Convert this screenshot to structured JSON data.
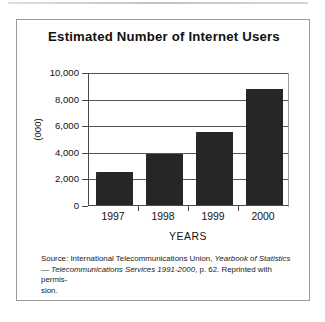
{
  "figure": {
    "title": "Estimated Number of Internet Users",
    "source_caption": {
      "line1_prefix": "Source: International Telecommunications Union, ",
      "line1_italic": "Yearbook of Statistics",
      "line2_dash": "— ",
      "line2_italic": "Telecommunications Services 1991-2000",
      "line2_suffix": ", p. 62. Reprinted with permis-",
      "line3": "sion."
    }
  },
  "chart_data": {
    "type": "bar",
    "title": "Estimated Number of Internet Users",
    "categories": [
      "1997",
      "1998",
      "1999",
      "2000"
    ],
    "values": [
      2500,
      3800,
      5500,
      8700
    ],
    "xlabel": "YEARS",
    "ylabel": "(000)",
    "ylim": [
      0,
      10000
    ],
    "yticks": [
      0,
      2000,
      4000,
      6000,
      8000,
      10000
    ],
    "ytick_labels": [
      "0",
      "2,000",
      "4,000",
      "6,000",
      "8,000",
      "10,000"
    ],
    "grid": true,
    "legend": false,
    "bar_color": "#262626",
    "axis_color": "#4a4a4a"
  }
}
